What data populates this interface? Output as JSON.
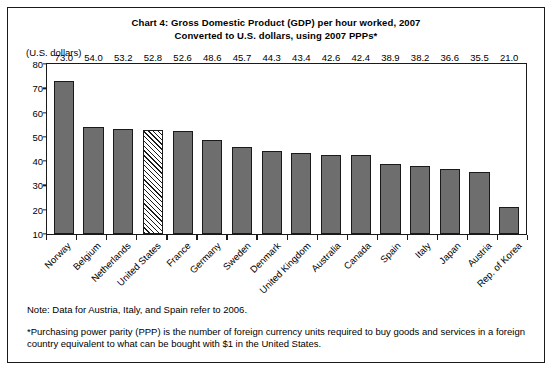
{
  "chart_data": {
    "type": "bar",
    "title": "Chart 4: Gross Domestic Product (GDP) per hour worked, 2007",
    "subtitle": "Converted to U.S. dollars, using 2007 PPPs*",
    "xlabel": "",
    "ylabel": "(U.S. dollars)",
    "ylim": [
      10,
      80
    ],
    "yticks": [
      80,
      70,
      60,
      50,
      40,
      30,
      20,
      10
    ],
    "grid": false,
    "legend": "none",
    "highlight_category": "United States",
    "highlight_style": "diagonal-hatch",
    "categories": [
      "Norway",
      "Belgium",
      "Netherlands",
      "United States",
      "France",
      "Germany",
      "Sweden",
      "Denmark",
      "United Kingdom",
      "Australia",
      "Canada",
      "Spain",
      "Italy",
      "Japan",
      "Austria",
      "Rep. of Korea"
    ],
    "values": [
      73.0,
      54.0,
      53.2,
      52.8,
      52.6,
      48.6,
      45.7,
      44.3,
      43.4,
      42.6,
      42.4,
      38.9,
      38.2,
      36.6,
      35.5,
      21.0
    ],
    "value_labels": [
      "73.0",
      "54.0",
      "53.2",
      "52.8",
      "52.6",
      "48.6",
      "45.7",
      "44.3",
      "43.4",
      "42.6",
      "42.4",
      "38.9",
      "38.2",
      "36.6",
      "35.5",
      "21.0"
    ]
  },
  "notes": {
    "data_note": "Note: Data for Austria, Italy, and Spain refer to 2006.",
    "ppp_note": "*Purchasing power parity (PPP) is the number of foreign currency units required to buy goods and services in a foreign country equivalent to what can be bought with $1 in the United States."
  },
  "colors": {
    "bar_fill": "#6e6e6e",
    "bar_outline": "#1a1a1a",
    "highlight_fill": "#ffffff",
    "background": "#ffffff",
    "text": "#000000"
  }
}
